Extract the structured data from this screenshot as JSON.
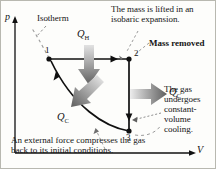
{
  "figure": {
    "type": "pressure-volume-diagram",
    "axes": {
      "y_label": "p",
      "x_label": "V"
    },
    "points": [
      {
        "id": "1",
        "label": "1",
        "x": 48,
        "y": 58
      },
      {
        "id": "2",
        "label": "2",
        "x": 128,
        "y": 58
      },
      {
        "id": "3",
        "label": "3",
        "x": 128,
        "y": 130
      }
    ],
    "heat_labels": {
      "q_hot": "Q",
      "q_hot_sub": "H",
      "q_cold": "Q",
      "q_cold_sub": "C"
    },
    "annotations": {
      "isotherm": "Isotherm",
      "isobaric": "The mass is lifted in an isobaric expansion.",
      "mass_removed": "Mass removed",
      "constant_volume": "The gas undergoes constant-volume cooling.",
      "compression": "An external force compresses the gas back to its initial conditions."
    },
    "colors": {
      "stroke": "#101010",
      "arrow_gray_dark": "#6a6a6a",
      "arrow_gray_light": "#d8d8d8",
      "frame": "#b8b8b0",
      "background": "#fdfdfb"
    }
  }
}
